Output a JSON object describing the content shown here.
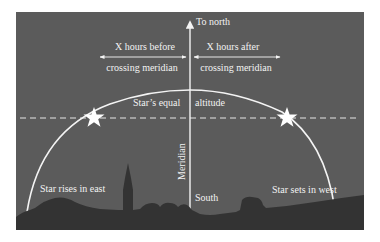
{
  "diagram": {
    "type": "celestial-meridian-star-path",
    "colors": {
      "sky": "#5b5b5b",
      "ground": "#333333",
      "lines": "#f4f4f4",
      "background": "#ffffff"
    },
    "labels": {
      "to_north": "To north",
      "before_line1": "X hours before",
      "before_line2": "crossing meridian",
      "after_line1": "X hours after",
      "after_line2": "crossing meridian",
      "equal_altitude_left": "Star’s  equal",
      "equal_altitude_right": "altitude",
      "meridian": "Meridian",
      "south": "South",
      "rises": "Star rises in east",
      "sets": "Star sets in west"
    },
    "elements": {
      "meridian_line_x": 190,
      "arc_peak_y": 90,
      "equal_altitude_y": 118,
      "star_left": {
        "x": 94,
        "y": 118
      },
      "star_right": {
        "x": 287,
        "y": 118
      }
    }
  }
}
